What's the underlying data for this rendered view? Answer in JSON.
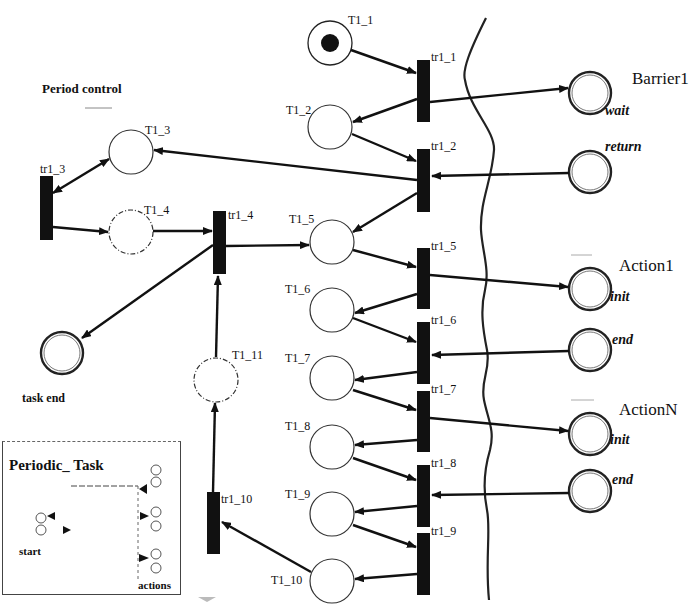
{
  "diagram": {
    "type": "petri-net",
    "title": "Period control",
    "places": [
      {
        "id": "T1_1",
        "label": "T1_1",
        "token": true
      },
      {
        "id": "T1_2",
        "label": "T1_2"
      },
      {
        "id": "T1_3",
        "label": "T1_3"
      },
      {
        "id": "T1_4",
        "label": "T1_4",
        "style": "dashed"
      },
      {
        "id": "T1_5",
        "label": "T1_5"
      },
      {
        "id": "T1_6",
        "label": "T1_6"
      },
      {
        "id": "T1_7",
        "label": "T1_7"
      },
      {
        "id": "T1_8",
        "label": "T1_8"
      },
      {
        "id": "T1_9",
        "label": "T1_9"
      },
      {
        "id": "T1_10",
        "label": "T1_10"
      },
      {
        "id": "T1_11",
        "label": "T1_11",
        "style": "dashed"
      },
      {
        "id": "task_end",
        "label": "task end",
        "style": "double"
      }
    ],
    "transitions": [
      "tr1_1",
      "tr1_2",
      "tr1_3",
      "tr1_4",
      "tr1_5",
      "tr1_6",
      "tr1_7",
      "tr1_8",
      "tr1_9",
      "tr1_10"
    ],
    "interfaces": [
      {
        "name": "Barrier1",
        "ports": [
          "wait",
          "return"
        ]
      },
      {
        "name": "Action1",
        "ports": [
          "init",
          "end"
        ]
      },
      {
        "name": "ActionN",
        "ports": [
          "init",
          "end"
        ]
      }
    ],
    "inset": {
      "title": "Periodic_ Task",
      "start_label": "start",
      "actions_label": "actions"
    }
  }
}
